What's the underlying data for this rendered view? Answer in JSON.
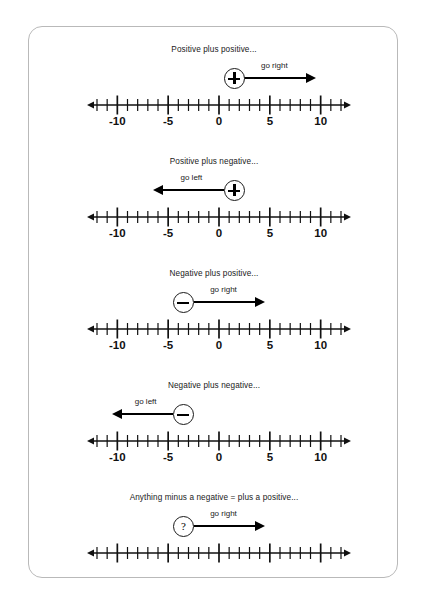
{
  "page": {
    "background": "#ffffff",
    "card_border_color": "#b9b9b9",
    "ink_color": "#1a1a1a"
  },
  "numberline": {
    "min": -12,
    "max": 12,
    "major_ticks": [
      -10,
      -5,
      0,
      5,
      10
    ],
    "labels": [
      "-10",
      "-5",
      "0",
      "5",
      "10"
    ],
    "label_values": [
      -10,
      -5,
      0,
      5,
      10
    ],
    "minor_tick_step": 1,
    "left_arrow": true,
    "right_arrow": true
  },
  "sections": [
    {
      "id": "positive-plus-positive",
      "caption": "Positive plus positive...",
      "symbol": "plus",
      "symbol_name": "plus-circle-icon",
      "direction": "right",
      "direction_label": "go right",
      "symbol_center_value": 1.5,
      "arrow_from_value": 2.5,
      "arrow_to_value": 9.5,
      "show_tick_labels": true
    },
    {
      "id": "positive-plus-negative",
      "caption": "Positive plus negative...",
      "symbol": "plus",
      "symbol_name": "plus-circle-icon",
      "direction": "left",
      "direction_label": "go left",
      "symbol_center_value": 1.5,
      "arrow_from_value": 0.5,
      "arrow_to_value": -6.5,
      "show_tick_labels": true
    },
    {
      "id": "negative-plus-positive",
      "caption": "Negative plus positive...",
      "symbol": "minus",
      "symbol_name": "minus-circle-icon",
      "direction": "right",
      "direction_label": "go right",
      "symbol_center_value": -3.5,
      "arrow_from_value": -2.5,
      "arrow_to_value": 4.5,
      "show_tick_labels": true
    },
    {
      "id": "negative-plus-negative",
      "caption": "Negative plus negative...",
      "symbol": "minus",
      "symbol_name": "minus-circle-icon",
      "direction": "left",
      "direction_label": "go left",
      "symbol_center_value": -3.5,
      "arrow_from_value": -4.5,
      "arrow_to_value": -10.5,
      "show_tick_labels": true
    },
    {
      "id": "anything-minus-a-negative",
      "caption": "Anything minus a negative = plus a positive...",
      "symbol": "question",
      "symbol_name": "question-circle-icon",
      "symbol_text": "?",
      "direction": "right",
      "direction_label": "go right",
      "symbol_center_value": -3.5,
      "arrow_from_value": -2.5,
      "arrow_to_value": 4.5,
      "show_tick_labels": false
    }
  ]
}
